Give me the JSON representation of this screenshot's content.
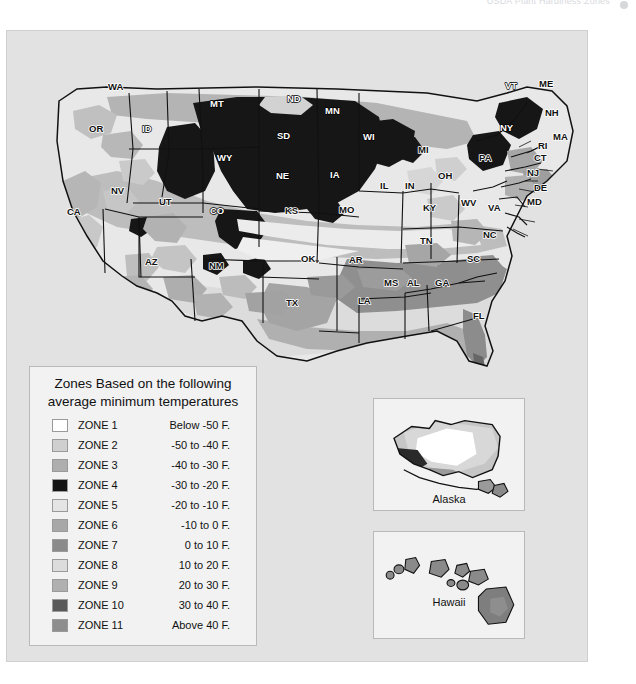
{
  "top_bar": {
    "faint_text": "USDA Plant Hardiness Zones",
    "dot_icon": "circle-icon"
  },
  "legend": {
    "title_line1": "Zones Based on the following",
    "title_line2": "average minimum temperatures",
    "rows": [
      {
        "zone": "ZONE 1",
        "temp": "Below -50 F.",
        "color": "#ffffff"
      },
      {
        "zone": "ZONE 2",
        "temp": "-50 to -40 F.",
        "color": "#cfcfcf"
      },
      {
        "zone": "ZONE 3",
        "temp": "-40 to -30 F.",
        "color": "#aeaeae"
      },
      {
        "zone": "ZONE 4",
        "temp": "-30 to -20 F.",
        "color": "#141414"
      },
      {
        "zone": "ZONE 5",
        "temp": "-20 to -10 F.",
        "color": "#e4e4e4"
      },
      {
        "zone": "ZONE 6",
        "temp": "-10 to 0 F.",
        "color": "#a8a8a8"
      },
      {
        "zone": "ZONE 7",
        "temp": "0 to 10 F.",
        "color": "#8a8a8a"
      },
      {
        "zone": "ZONE 8",
        "temp": "10 to 20 F.",
        "color": "#dcdcdc"
      },
      {
        "zone": "ZONE 9",
        "temp": "20 to 30 F.",
        "color": "#b0b0b0"
      },
      {
        "zone": "ZONE 10",
        "temp": "30 to 40 F.",
        "color": "#5a5a5a"
      },
      {
        "zone": "ZONE 11",
        "temp": "Above 40 F.",
        "color": "#8e8e8e"
      }
    ]
  },
  "insets": {
    "alaska_caption": "Alaska",
    "hawaii_caption": "Hawaii"
  },
  "states": [
    {
      "abbr": "WA",
      "x": 107,
      "y": 89
    },
    {
      "abbr": "OR",
      "x": 88,
      "y": 131
    },
    {
      "abbr": "ID",
      "x": 141,
      "y": 131
    },
    {
      "abbr": "MT",
      "x": 209,
      "y": 106
    },
    {
      "abbr": "WY",
      "x": 216,
      "y": 160
    },
    {
      "abbr": "NV",
      "x": 110,
      "y": 193
    },
    {
      "abbr": "UT",
      "x": 158,
      "y": 204
    },
    {
      "abbr": "CA",
      "x": 66,
      "y": 214
    },
    {
      "abbr": "CO",
      "x": 209,
      "y": 213
    },
    {
      "abbr": "AZ",
      "x": 144,
      "y": 264
    },
    {
      "abbr": "NM",
      "x": 208,
      "y": 268
    },
    {
      "abbr": "ND",
      "x": 286,
      "y": 101
    },
    {
      "abbr": "SD",
      "x": 276,
      "y": 138
    },
    {
      "abbr": "NE",
      "x": 275,
      "y": 178
    },
    {
      "abbr": "KS",
      "x": 284,
      "y": 213
    },
    {
      "abbr": "OK",
      "x": 300,
      "y": 261
    },
    {
      "abbr": "TX",
      "x": 285,
      "y": 305
    },
    {
      "abbr": "MN",
      "x": 324,
      "y": 113
    },
    {
      "abbr": "IA",
      "x": 329,
      "y": 177
    },
    {
      "abbr": "MO",
      "x": 338,
      "y": 212
    },
    {
      "abbr": "AR",
      "x": 348,
      "y": 262
    },
    {
      "abbr": "LA",
      "x": 357,
      "y": 303
    },
    {
      "abbr": "WI",
      "x": 362,
      "y": 139
    },
    {
      "abbr": "IL",
      "x": 379,
      "y": 188
    },
    {
      "abbr": "MS",
      "x": 383,
      "y": 285
    },
    {
      "abbr": "MI",
      "x": 417,
      "y": 152
    },
    {
      "abbr": "IN",
      "x": 404,
      "y": 188
    },
    {
      "abbr": "KY",
      "x": 422,
      "y": 210
    },
    {
      "abbr": "TN",
      "x": 419,
      "y": 243
    },
    {
      "abbr": "AL",
      "x": 406,
      "y": 285
    },
    {
      "abbr": "GA",
      "x": 434,
      "y": 285
    },
    {
      "abbr": "OH",
      "x": 437,
      "y": 178
    },
    {
      "abbr": "WV",
      "x": 460,
      "y": 205
    },
    {
      "abbr": "VA",
      "x": 487,
      "y": 210
    },
    {
      "abbr": "NC",
      "x": 482,
      "y": 237
    },
    {
      "abbr": "SC",
      "x": 466,
      "y": 261
    },
    {
      "abbr": "FL",
      "x": 472,
      "y": 318
    },
    {
      "abbr": "PA",
      "x": 478,
      "y": 160
    },
    {
      "abbr": "NY",
      "x": 499,
      "y": 130
    },
    {
      "abbr": "VT",
      "x": 504,
      "y": 88
    },
    {
      "abbr": "ME",
      "x": 538,
      "y": 86
    },
    {
      "abbr": "NH",
      "x": 544,
      "y": 115
    },
    {
      "abbr": "MA",
      "x": 552,
      "y": 139
    },
    {
      "abbr": "RI",
      "x": 537,
      "y": 148
    },
    {
      "abbr": "CT",
      "x": 533,
      "y": 160
    },
    {
      "abbr": "NJ",
      "x": 526,
      "y": 175
    },
    {
      "abbr": "DE",
      "x": 533,
      "y": 190
    },
    {
      "abbr": "MD",
      "x": 526,
      "y": 204
    }
  ],
  "chart_data": {
    "type": "map",
    "zones": [
      {
        "zone": 1,
        "range": "Below -50 F.",
        "shade": "#ffffff"
      },
      {
        "zone": 2,
        "range": "-50 to -40 F.",
        "shade": "#cfcfcf"
      },
      {
        "zone": 3,
        "range": "-40 to -30 F.",
        "shade": "#aeaeae"
      },
      {
        "zone": 4,
        "range": "-30 to -20 F.",
        "shade": "#141414"
      },
      {
        "zone": 5,
        "range": "-20 to -10 F.",
        "shade": "#e4e4e4"
      },
      {
        "zone": 6,
        "range": "-10 to 0 F.",
        "shade": "#a8a8a8"
      },
      {
        "zone": 7,
        "range": "0 to 10 F.",
        "shade": "#8a8a8a"
      },
      {
        "zone": 8,
        "range": "10 to 20 F.",
        "shade": "#dcdcdc"
      },
      {
        "zone": 9,
        "range": "20 to 30 F.",
        "shade": "#b0b0b0"
      },
      {
        "zone": 10,
        "range": "30 to 40 F.",
        "shade": "#5a5a5a"
      },
      {
        "zone": 11,
        "range": "Above 40 F.",
        "shade": "#8e8e8e"
      }
    ],
    "insets": [
      "Alaska",
      "Hawaii"
    ],
    "state_count": 49
  }
}
